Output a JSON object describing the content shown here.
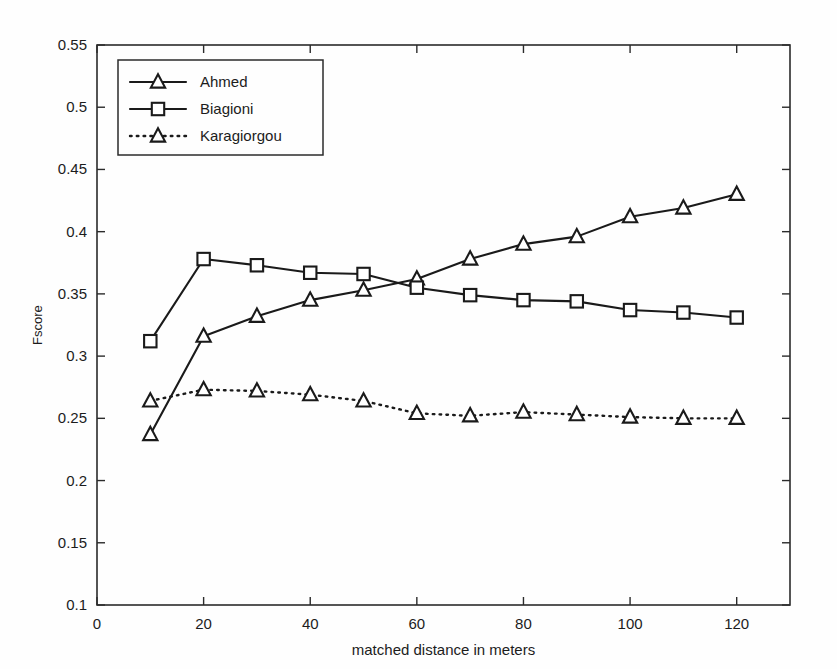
{
  "chart_data": {
    "type": "line",
    "title": "",
    "xlabel": "matched distance in meters",
    "ylabel": "Fscore",
    "xlim": [
      0,
      130
    ],
    "ylim": [
      0.1,
      0.55
    ],
    "xticks": [
      0,
      20,
      40,
      60,
      80,
      100,
      120
    ],
    "yticks": [
      0.1,
      0.15,
      0.2,
      0.25,
      0.3,
      0.35,
      0.4,
      0.45,
      0.5,
      0.55
    ],
    "ytick_labels": [
      "0.1",
      "0.15",
      "0.2",
      "0.25",
      "0.3",
      "0.35",
      "0.4",
      "0.45",
      "0.5",
      "0.55"
    ],
    "xtick_labels": [
      "0",
      "20",
      "40",
      "60",
      "80",
      "100",
      "120"
    ],
    "grid": false,
    "legend_position": "top-left",
    "x": [
      10,
      20,
      30,
      40,
      50,
      60,
      70,
      80,
      90,
      100,
      110,
      120
    ],
    "series": [
      {
        "name": "Ahmed",
        "marker": "triangle",
        "linestyle": "solid",
        "color": "#1a1a1a",
        "values": [
          0.237,
          0.316,
          0.332,
          0.345,
          0.353,
          0.362,
          0.378,
          0.39,
          0.396,
          0.412,
          0.419,
          0.43
        ]
      },
      {
        "name": "Biagioni",
        "marker": "square",
        "linestyle": "solid",
        "color": "#1a1a1a",
        "values": [
          0.312,
          0.378,
          0.373,
          0.367,
          0.366,
          0.355,
          0.349,
          0.345,
          0.344,
          0.337,
          0.335,
          0.331
        ]
      },
      {
        "name": "Karagiorgou",
        "marker": "triangle",
        "linestyle": "dotted",
        "color": "#1a1a1a",
        "values": [
          0.264,
          0.273,
          0.272,
          0.269,
          0.264,
          0.254,
          0.252,
          0.255,
          0.253,
          0.251,
          0.25,
          0.25
        ]
      }
    ]
  },
  "legend": {
    "entries": [
      {
        "label": "Ahmed"
      },
      {
        "label": "Biagioni"
      },
      {
        "label": "Karagiorgou"
      }
    ]
  }
}
